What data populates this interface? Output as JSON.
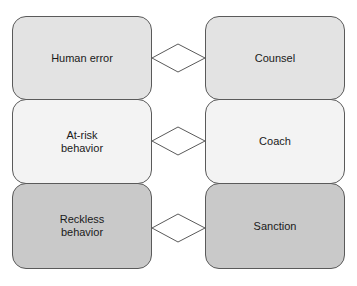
{
  "diagram": {
    "rows": [
      {
        "behavior": "Human error",
        "response": "Counsel",
        "fill": "#e3e3e3"
      },
      {
        "behavior": "At-risk\nbehavior",
        "response": "Coach",
        "fill": "#f3f3f3"
      },
      {
        "behavior": "Reckless\nbehavior",
        "response": "Sanction",
        "fill": "#c9c9c9"
      }
    ],
    "connector_shape": "diamond"
  }
}
